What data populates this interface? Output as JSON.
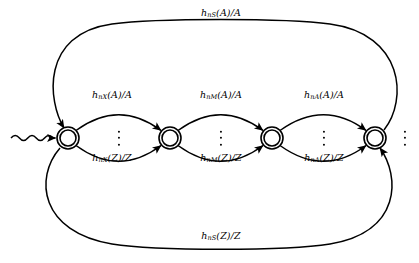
{
  "diagram": {
    "type": "finite-state-automaton",
    "title": "",
    "background_color": "#ffffff",
    "stroke_color": "#000000",
    "states": [
      {
        "id": "s1",
        "label": "",
        "shape": "double-circle",
        "x": 68,
        "y": 138,
        "r_outer": 11,
        "r_inner": 8
      },
      {
        "id": "s2",
        "label": "",
        "shape": "double-circle",
        "x": 170,
        "y": 138,
        "r_outer": 11,
        "r_inner": 8
      },
      {
        "id": "s3",
        "label": "",
        "shape": "double-circle",
        "x": 272,
        "y": 138,
        "r_outer": 11,
        "r_inner": 8
      },
      {
        "id": "s4",
        "label": "",
        "shape": "double-circle",
        "x": 375,
        "y": 138,
        "r_outer": 11,
        "r_inner": 8
      }
    ],
    "start_arrow": {
      "style": "wavy",
      "x_from": 12,
      "x_to": 55,
      "y": 138
    },
    "transitions": [
      {
        "id": "t1-upper",
        "from": "s1",
        "to": "s2",
        "arc": "upper-lens",
        "label_html": "h<sub>nX</sub>(A)/A",
        "label_x": 112,
        "label_y": 95
      },
      {
        "id": "t1-lower",
        "from": "s1",
        "to": "s2",
        "arc": "lower-lens",
        "label_html": "h<sub>nX</sub>(Z)/Z",
        "label_x": 112,
        "label_y": 158
      },
      {
        "id": "t2-upper",
        "from": "s2",
        "to": "s3",
        "arc": "upper-lens",
        "label_html": "h<sub>nM</sub>(A)/A",
        "label_x": 221,
        "label_y": 95
      },
      {
        "id": "t2-lower",
        "from": "s2",
        "to": "s3",
        "arc": "lower-lens",
        "label_html": "h<sub>nM</sub>(Z)/Z",
        "label_x": 221,
        "label_y": 158
      },
      {
        "id": "t3-upper",
        "from": "s3",
        "to": "s4",
        "arc": "upper-lens",
        "label_html": "h<sub>nA</sub>(A)/A",
        "label_x": 324,
        "label_y": 95
      },
      {
        "id": "t3-lower",
        "from": "s3",
        "to": "s4",
        "arc": "lower-lens",
        "label_html": "h<sub>nA</sub>(Z)/Z",
        "label_x": 324,
        "label_y": 158
      },
      {
        "id": "t-top-return",
        "from": "s4",
        "to": "s1",
        "arc": "outer-top",
        "label_html": "h<sub>nS</sub>(A)/A",
        "label_x": 221,
        "label_y": 13
      },
      {
        "id": "t-bottom-return",
        "from": "s1",
        "to": "s4",
        "arc": "outer-bottom",
        "label_html": "h<sub>nS</sub>(Z)/Z",
        "label_x": 221,
        "label_y": 236
      }
    ],
    "ellipses": [
      {
        "id": "dots-lens-1",
        "x": 119,
        "y": 138,
        "count": 3,
        "orientation": "vertical"
      },
      {
        "id": "dots-lens-2",
        "x": 221,
        "y": 138,
        "count": 3,
        "orientation": "vertical"
      },
      {
        "id": "dots-lens-3",
        "x": 324,
        "y": 138,
        "count": 3,
        "orientation": "vertical"
      },
      {
        "id": "dots-trailing",
        "x": 405,
        "y": 138,
        "count": 3,
        "orientation": "vertical"
      }
    ]
  }
}
